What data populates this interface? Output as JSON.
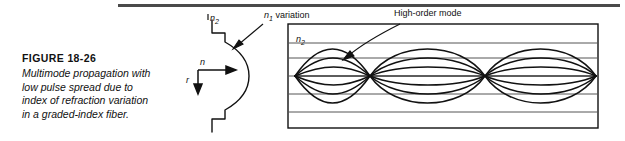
{
  "figure": {
    "title": "FIGURE 18-26",
    "caption_lines": [
      "Multimode propagation with",
      "low pulse spread due to",
      "index of refraction variation",
      "in a graded-index fiber."
    ]
  },
  "labels": {
    "cladding_index_profile": "n2",
    "cladding_index_profile_base": "n",
    "cladding_index_profile_sub": "2",
    "core_variation_base": "n",
    "core_variation_sub": "1",
    "core_variation_rest": " variation",
    "high_order_mode": "High-order mode",
    "cladding_index_box_base": "n",
    "cladding_index_box_sub": "2",
    "axis_index": "n",
    "axis_radius": "r"
  },
  "colors": {
    "line": "#111111",
    "rule": "#4a4a4a",
    "cladding_line": "#555555",
    "background": "#ffffff"
  },
  "diagram": {
    "fiber_box": {
      "x": 288,
      "y": 24,
      "width": 310,
      "height": 104
    },
    "cladding_boundaries_y": [
      43,
      58,
      74,
      94,
      112
    ],
    "axis_center_y": 76,
    "node_x": [
      295,
      370,
      485,
      596
    ],
    "mode_count": 4
  }
}
